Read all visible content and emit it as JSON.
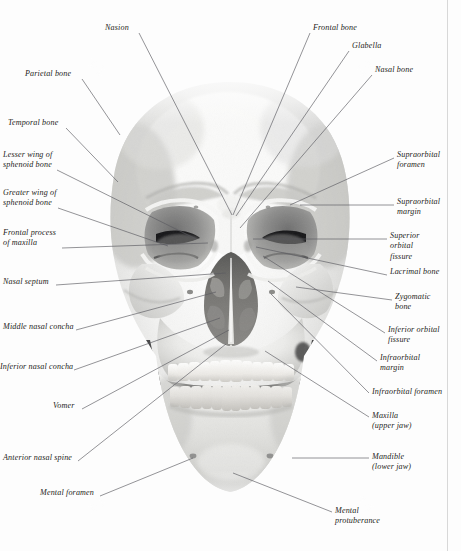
{
  "figure": {
    "view": "anterior",
    "background_color": "#fdfdfd",
    "ink_color": "#1d1d22",
    "leader_color": "#5a5a60",
    "margin_rule_color": "#d8d8d8"
  },
  "labels": [
    {
      "id": "nasion",
      "side": "left",
      "text": "Nasion",
      "lines": [
        "Nasion"
      ],
      "x": 105,
      "y": 23,
      "anchor_x": 139,
      "anchor_y": 33,
      "target_x": 232,
      "target_y": 215
    },
    {
      "id": "parietal-bone",
      "side": "left",
      "text": "Parietal bone",
      "lines": [
        "Parietal bone"
      ],
      "x": 25,
      "y": 69,
      "anchor_x": 82,
      "anchor_y": 79,
      "target_x": 120,
      "target_y": 135
    },
    {
      "id": "temporal-bone",
      "side": "left",
      "text": "Temporal bone",
      "lines": [
        "Temporal bone"
      ],
      "x": 8,
      "y": 118,
      "anchor_x": 66,
      "anchor_y": 128,
      "target_x": 118,
      "target_y": 182
    },
    {
      "id": "lesser-wing-sphenoid",
      "side": "left",
      "text": "Lesser wing of sphenoid bone",
      "lines": [
        "Lesser wing of",
        "sphenoid bone"
      ],
      "x": 3,
      "y": 150,
      "anchor_x": 57,
      "anchor_y": 170,
      "target_x": 196,
      "target_y": 239
    },
    {
      "id": "greater-wing-sphenoid",
      "side": "left",
      "text": "Greater wing of sphenoid bone",
      "lines": [
        "Greater wing of",
        "sphenoid bone"
      ],
      "x": 3,
      "y": 188,
      "anchor_x": 58,
      "anchor_y": 208,
      "target_x": 168,
      "target_y": 246
    },
    {
      "id": "frontal-process-maxilla",
      "side": "left",
      "text": "Frontal process of maxilla",
      "lines": [
        "Frontal process",
        "of maxilla"
      ],
      "x": 3,
      "y": 228,
      "anchor_x": 62,
      "anchor_y": 248,
      "target_x": 208,
      "target_y": 243
    },
    {
      "id": "nasal-septum",
      "side": "left",
      "text": "Nasal septum",
      "lines": [
        "Nasal septum"
      ],
      "x": 3,
      "y": 277,
      "anchor_x": 56,
      "anchor_y": 285,
      "target_x": 226,
      "target_y": 273
    },
    {
      "id": "middle-nasal-concha",
      "side": "left",
      "text": "Middle nasal concha",
      "lines": [
        "Middle nasal concha"
      ],
      "x": 3,
      "y": 322,
      "anchor_x": 76,
      "anchor_y": 330,
      "target_x": 216,
      "target_y": 292
    },
    {
      "id": "inferior-nasal-concha",
      "side": "left",
      "text": "Inferior nasal concha",
      "lines": [
        "Inferior nasal concha"
      ],
      "x": 0,
      "y": 362,
      "anchor_x": 74,
      "anchor_y": 370,
      "target_x": 220,
      "target_y": 318
    },
    {
      "id": "vomer",
      "side": "left",
      "text": "Vomer",
      "lines": [
        "Vomer"
      ],
      "x": 53,
      "y": 401,
      "anchor_x": 82,
      "anchor_y": 409,
      "target_x": 229,
      "target_y": 330
    },
    {
      "id": "anterior-nasal-spine",
      "side": "left",
      "text": "Anterior nasal spine",
      "lines": [
        "Anterior nasal spine"
      ],
      "x": 3,
      "y": 453,
      "anchor_x": 78,
      "anchor_y": 461,
      "target_x": 226,
      "target_y": 344
    },
    {
      "id": "mental-foramen",
      "side": "left",
      "text": "Mental foramen",
      "lines": [
        "Mental foramen"
      ],
      "x": 40,
      "y": 488,
      "anchor_x": 100,
      "anchor_y": 496,
      "target_x": 193,
      "target_y": 458
    },
    {
      "id": "frontal-bone",
      "side": "right",
      "text": "Frontal bone",
      "lines": [
        "Frontal bone"
      ],
      "x": 313,
      "y": 23,
      "anchor_x": 310,
      "anchor_y": 33,
      "target_x": 233,
      "target_y": 215
    },
    {
      "id": "glabella",
      "side": "right",
      "text": "Glabella",
      "lines": [
        "Glabella"
      ],
      "x": 352,
      "y": 41,
      "anchor_x": 349,
      "anchor_y": 51,
      "target_x": 236,
      "target_y": 216
    },
    {
      "id": "nasal-bone",
      "side": "right",
      "text": "Nasal bone",
      "lines": [
        "Nasal bone"
      ],
      "x": 375,
      "y": 65,
      "anchor_x": 372,
      "anchor_y": 75,
      "target_x": 240,
      "target_y": 228
    },
    {
      "id": "supraorbital-foramen",
      "side": "right",
      "text": "Supraorbital foramen",
      "lines": [
        "Supraorbital",
        "foramen"
      ],
      "x": 397,
      "y": 150,
      "anchor_x": 394,
      "anchor_y": 158,
      "target_x": 290,
      "target_y": 205
    },
    {
      "id": "supraorbital-margin",
      "side": "right",
      "text": "Supraorbital margin",
      "lines": [
        "Supraorbital",
        "margin"
      ],
      "x": 397,
      "y": 197,
      "anchor_x": 394,
      "anchor_y": 205,
      "target_x": 300,
      "target_y": 205
    },
    {
      "id": "superior-orbital-fissure",
      "side": "right",
      "text": "Superior orbital fissure",
      "lines": [
        "Superior",
        "orbital",
        "fissure"
      ],
      "x": 390,
      "y": 231,
      "anchor_x": 387,
      "anchor_y": 239,
      "target_x": 253,
      "target_y": 239
    },
    {
      "id": "lacrimal-bone",
      "side": "right",
      "text": "Lacrimal bone",
      "lines": [
        "Lacrimal bone"
      ],
      "x": 390,
      "y": 267,
      "anchor_x": 387,
      "anchor_y": 275,
      "target_x": 256,
      "target_y": 247
    },
    {
      "id": "zygomatic-bone",
      "side": "right",
      "text": "Zygomatic bone",
      "lines": [
        "Zygomatic",
        "bone"
      ],
      "x": 395,
      "y": 292,
      "anchor_x": 392,
      "anchor_y": 300,
      "target_x": 296,
      "target_y": 287
    },
    {
      "id": "inferior-orbital-fissure",
      "side": "right",
      "text": "Inferior orbital fissure",
      "lines": [
        "Inferior orbital",
        "fissure"
      ],
      "x": 388,
      "y": 325,
      "anchor_x": 385,
      "anchor_y": 333,
      "target_x": 263,
      "target_y": 256
    },
    {
      "id": "infraorbital-margin",
      "side": "right",
      "text": "Infraorbital margin",
      "lines": [
        "Infraorbital",
        "margin"
      ],
      "x": 380,
      "y": 353,
      "anchor_x": 377,
      "anchor_y": 361,
      "target_x": 268,
      "target_y": 281
    },
    {
      "id": "infraorbital-foramen",
      "side": "right",
      "text": "Infraorbital foramen",
      "lines": [
        "Infraorbital foramen"
      ],
      "x": 372,
      "y": 387,
      "anchor_x": 369,
      "anchor_y": 393,
      "target_x": 271,
      "target_y": 294
    },
    {
      "id": "maxilla",
      "side": "right",
      "text": "Maxilla (upper jaw)",
      "lines": [
        "Maxilla",
        "(upper jaw)"
      ],
      "x": 372,
      "y": 411,
      "anchor_x": 369,
      "anchor_y": 417,
      "target_x": 265,
      "target_y": 351
    },
    {
      "id": "mandible",
      "side": "right",
      "text": "Mandible (lower jaw)",
      "lines": [
        "Mandible",
        "(lower jaw)"
      ],
      "x": 372,
      "y": 452,
      "anchor_x": 369,
      "anchor_y": 458,
      "target_x": 292,
      "target_y": 458
    },
    {
      "id": "mental-protuberance",
      "side": "right",
      "text": "Mental protuberance",
      "lines": [
        "Mental",
        "protuberance"
      ],
      "x": 335,
      "y": 506,
      "anchor_x": 332,
      "anchor_y": 512,
      "target_x": 233,
      "target_y": 473
    }
  ]
}
